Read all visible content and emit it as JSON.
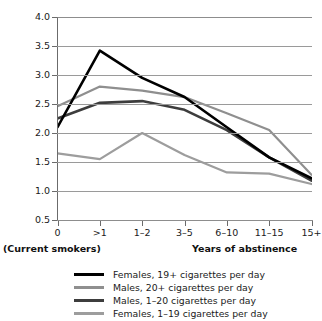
{
  "chart_data": {
    "type": "line",
    "title": "",
    "xlabel": "Years of abstinence",
    "ylabel": "Mortality ratio",
    "categories": [
      "0",
      ">1",
      "1–2",
      "3–5",
      "6–10",
      "11–15",
      "15+"
    ],
    "ylim": [
      0.5,
      4.0
    ],
    "ytick_labels": [
      "4.0",
      "3.5",
      "3.0",
      "2.5",
      "2.0",
      "1.5",
      "1.0",
      "0.5"
    ],
    "ytick_values": [
      4.0,
      3.5,
      3.0,
      2.5,
      2.0,
      1.5,
      1.0,
      0.5
    ],
    "grid": true,
    "legend_position": "bottom",
    "x_axis_captions": {
      "left": "(Current smokers)",
      "right": "Years of abstinence"
    },
    "series": [
      {
        "name": "Females, 19+ cigarettes per day",
        "color": "#000000",
        "width": 2.6,
        "values": [
          2.1,
          3.42,
          2.95,
          2.62,
          2.1,
          1.58,
          1.22
        ]
      },
      {
        "name": "Males, 20+ cigarettes per day",
        "color": "#8f8f8f",
        "width": 2.2,
        "values": [
          2.46,
          2.8,
          2.73,
          2.62,
          2.34,
          2.05,
          1.28
        ]
      },
      {
        "name": "Males, 1–20 cigarettes per day",
        "color": "#3d3d3d",
        "width": 2.6,
        "values": [
          2.25,
          2.52,
          2.55,
          2.4,
          2.05,
          1.58,
          1.18
        ]
      },
      {
        "name": "Females, 1–19 cigarettes per day",
        "color": "#9d9d9d",
        "width": 2.2,
        "values": [
          1.65,
          1.55,
          2.0,
          1.62,
          1.32,
          1.3,
          1.12
        ]
      }
    ]
  },
  "legend": {
    "items": [
      {
        "label": "Females, 19+ cigarettes per day",
        "color": "#000000",
        "thickness": "3px"
      },
      {
        "label": "Males, 20+ cigarettes per day",
        "color": "#8f8f8f",
        "thickness": "3px"
      },
      {
        "label": "Males, 1–20 cigarettes per day",
        "color": "#3d3d3d",
        "thickness": "3px"
      },
      {
        "label": "Females, 1–19 cigarettes per day",
        "color": "#9d9d9d",
        "thickness": "3px"
      }
    ]
  }
}
